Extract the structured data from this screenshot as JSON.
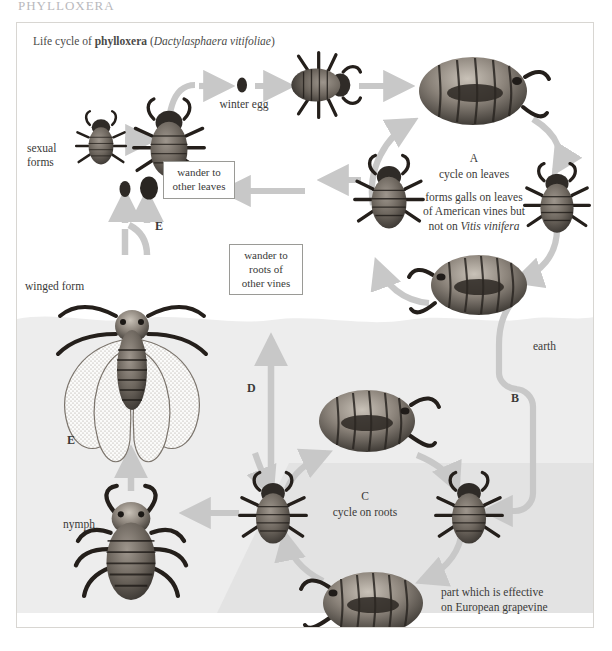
{
  "page": {
    "header": "PHYLLOXERA"
  },
  "figure": {
    "title_prefix": "Life cycle of ",
    "title_bold": "phylloxera",
    "title_paren_open": " (",
    "title_italic": "Dactylasphaera vitifoliae",
    "title_paren_close": ")"
  },
  "labels": {
    "winter_egg": "winter egg",
    "sexual_forms": "sexual\nforms",
    "winged_form": "winged form",
    "nymph": "nymph",
    "earth": "earth",
    "cycle_a_letter": "A",
    "cycle_a_title": "cycle on leaves",
    "cycle_a_note_line1": "forms galls on leaves",
    "cycle_a_note_line2": "of American vines but",
    "cycle_a_note_line3_pre": "not on ",
    "cycle_a_note_line3_italic": "Vitis vinifera",
    "cycle_c_letter": "C",
    "cycle_c_title": "cycle on roots",
    "letter_b": "B",
    "letter_d": "D",
    "letter_e_upper": "E",
    "letter_e_lower": "E",
    "effective_line1": "part which is effective",
    "effective_line2": "on European grapevine"
  },
  "boxes": [
    {
      "name": "wander-to-other-leaves",
      "line1": "wander to",
      "line2": "other leaves",
      "line3": ""
    },
    {
      "name": "wander-to-roots-of-other-vines",
      "line1": "wander to",
      "line2": "roots of",
      "line3": "other vines"
    }
  ],
  "colors": {
    "arrow": "#c8c8c8",
    "earth_fill": "#ededed",
    "effective_fill": "#e3e3e3",
    "frame_border": "#d8d6d2",
    "text": "#3a3a38",
    "box_border": "#9a9a96",
    "insect_dark": "#3b3733",
    "insect_mid": "#7a736c",
    "insect_light": "#cfc8c0"
  }
}
